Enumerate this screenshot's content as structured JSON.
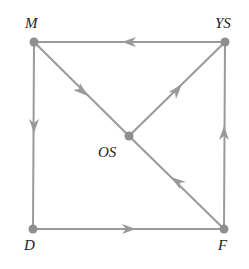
{
  "diagram": {
    "type": "directed-graph",
    "colors": {
      "edge": "#9a9a9a",
      "node": "#8f8f8f",
      "label": "#222222"
    },
    "nodes": [
      {
        "id": "M",
        "label": "M",
        "x": 34,
        "y": 42
      },
      {
        "id": "YS",
        "label": "YS",
        "x": 225,
        "y": 42
      },
      {
        "id": "OS",
        "label": "OS",
        "x": 129,
        "y": 136
      },
      {
        "id": "D",
        "label": "D",
        "x": 33,
        "y": 229
      },
      {
        "id": "F",
        "label": "F",
        "x": 224,
        "y": 229
      }
    ],
    "edges": [
      {
        "from": "YS",
        "to": "M"
      },
      {
        "from": "M",
        "to": "D"
      },
      {
        "from": "M",
        "to": "OS"
      },
      {
        "from": "OS",
        "to": "YS"
      },
      {
        "from": "D",
        "to": "F"
      },
      {
        "from": "F",
        "to": "YS"
      },
      {
        "from": "F",
        "to": "OS"
      }
    ]
  }
}
